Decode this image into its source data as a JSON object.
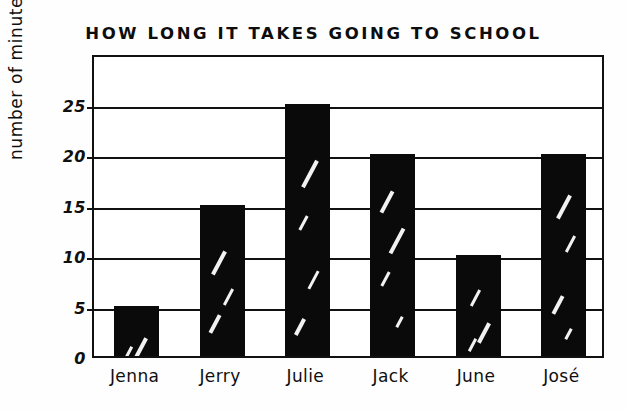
{
  "chart_data": {
    "type": "bar",
    "title": "HOW LONG IT TAKES GOING TO SCHOOL",
    "xlabel": "",
    "ylabel": "number of minutes",
    "categories": [
      "Jenna",
      "Jerry",
      "Julie",
      "Jack",
      "June",
      "José"
    ],
    "values": [
      5,
      15,
      25,
      20,
      10,
      20
    ],
    "ylim": [
      0,
      30
    ],
    "yticks": [
      0,
      5,
      10,
      15,
      20,
      25
    ],
    "ytick_labels": [
      "0",
      "5",
      "10",
      "15",
      "20",
      "25"
    ],
    "grid": "horizontal",
    "legend": "none",
    "bar_color": "#0a0a0a",
    "axis_color": "#111111",
    "background_color": "#fefefe"
  }
}
